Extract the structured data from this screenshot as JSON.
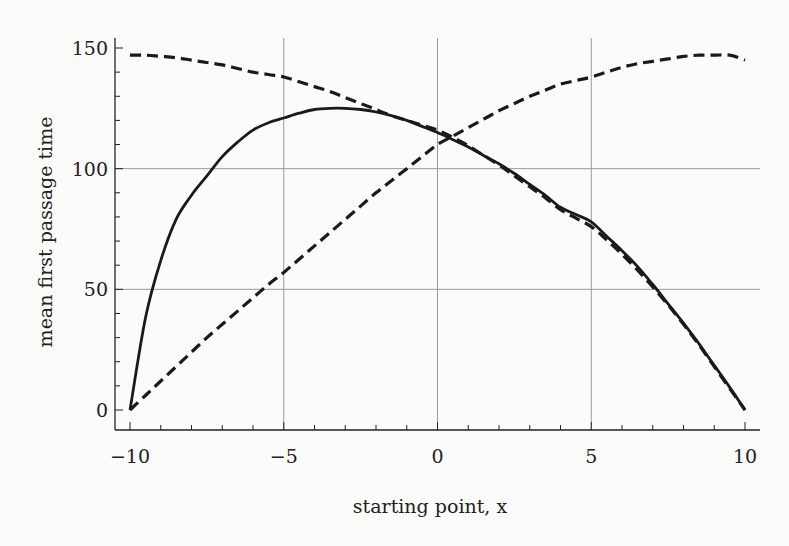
{
  "chart_data": {
    "type": "line",
    "title": "",
    "xlabel": "starting point, x",
    "ylabel": "mean first passage time",
    "xlim": [
      -10,
      10
    ],
    "ylim": [
      -5,
      155
    ],
    "grid": true,
    "legend": null,
    "x_ticks": [
      -10,
      -5,
      0,
      5,
      10
    ],
    "x_tick_labels": [
      "−10",
      "−5",
      "0",
      "5",
      "10"
    ],
    "y_ticks": [
      0,
      50,
      100,
      150
    ],
    "y_tick_labels": [
      "0",
      "50",
      "100",
      "150"
    ],
    "x": [
      -10,
      -9.5,
      -9,
      -8.5,
      -8,
      -7.5,
      -7,
      -6.5,
      -6,
      -5.5,
      -5,
      -4.5,
      -4,
      -3.5,
      -3,
      -2.5,
      -2,
      -1.5,
      -1,
      -0.5,
      0,
      0.5,
      1,
      1.5,
      2,
      2.5,
      3,
      3.5,
      4,
      4.5,
      5,
      5.5,
      6,
      6.5,
      7,
      7.5,
      8,
      8.5,
      9,
      9.5,
      10
    ],
    "series": [
      {
        "name": "solid",
        "style": "solid",
        "color": "#1a1a1a",
        "values": [
          0,
          38,
          62,
          79,
          89,
          97,
          105,
          111,
          116,
          119,
          121,
          123,
          124.5,
          125,
          125,
          124.5,
          123.5,
          122,
          120,
          117.5,
          115,
          112,
          109,
          105.5,
          102,
          98,
          93.5,
          89,
          84,
          81,
          78,
          72,
          66,
          59.5,
          52,
          44,
          36,
          27.5,
          18.5,
          9.5,
          0
        ]
      },
      {
        "name": "dashed-decreasing",
        "style": "dashed",
        "color": "#1a1a1a",
        "values": [
          147,
          147,
          146.5,
          146,
          145,
          144,
          143,
          141.5,
          140,
          139,
          138,
          136,
          134,
          132,
          129.5,
          127,
          124.5,
          122,
          120,
          118,
          116,
          113,
          109.5,
          105.5,
          101.5,
          97,
          92.5,
          88,
          83,
          79.5,
          76,
          70.5,
          64.5,
          58,
          51,
          43.5,
          35.5,
          27,
          18,
          9,
          0
        ]
      },
      {
        "name": "dashed-increasing",
        "style": "dashed",
        "color": "#1a1a1a",
        "values": [
          0,
          6,
          12,
          18,
          24,
          30,
          35.5,
          41,
          46.5,
          52,
          57,
          62.5,
          68,
          73.5,
          79,
          84.5,
          90,
          95,
          100,
          105,
          110,
          113.5,
          117,
          120.5,
          124,
          127,
          130,
          132.5,
          135,
          136.5,
          138,
          140,
          142,
          143.5,
          144.5,
          145.5,
          146.5,
          147,
          147,
          147,
          145
        ]
      }
    ]
  }
}
